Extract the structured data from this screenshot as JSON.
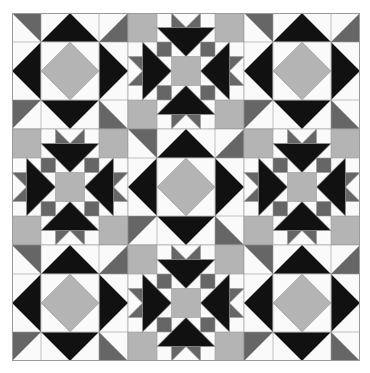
{
  "quilt": {
    "title": "",
    "rows": 3,
    "cols": 3,
    "layout": [
      [
        "diamond",
        "star",
        "diamond"
      ],
      [
        "star",
        "diamond",
        "star"
      ],
      [
        "diamond",
        "star",
        "diamond"
      ]
    ],
    "colors": {
      "black": "#111111",
      "dark_gray": "#666666",
      "light_gray": "#b4b4b4",
      "white": "#fafafa",
      "seam": "#9a9a9a"
    }
  }
}
